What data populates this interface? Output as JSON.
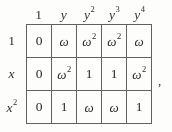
{
  "figure": {
    "kind": "math-table",
    "background_color": "#fdfdfc",
    "rule_color": "#5d5d5d",
    "text_color": "#222222",
    "trailing_punctuation": ","
  },
  "table": {
    "column_headers": [
      {
        "base": "1",
        "sup": "",
        "italic": false
      },
      {
        "base": "y",
        "sup": "",
        "italic": true
      },
      {
        "base": "y",
        "sup": "2",
        "italic": true
      },
      {
        "base": "y",
        "sup": "3",
        "italic": true
      },
      {
        "base": "y",
        "sup": "4",
        "italic": true
      }
    ],
    "row_headers": [
      {
        "base": "1",
        "sup": "",
        "italic": false
      },
      {
        "base": "x",
        "sup": "",
        "italic": true
      },
      {
        "base": "x",
        "sup": "2",
        "italic": true
      }
    ],
    "rows": [
      [
        {
          "base": "0",
          "sup": ""
        },
        {
          "base": "ω",
          "sup": ""
        },
        {
          "base": "ω",
          "sup": "2"
        },
        {
          "base": "ω",
          "sup": "2"
        },
        {
          "base": "ω",
          "sup": ""
        }
      ],
      [
        {
          "base": "0",
          "sup": ""
        },
        {
          "base": "ω",
          "sup": "2"
        },
        {
          "base": "1",
          "sup": ""
        },
        {
          "base": "1",
          "sup": ""
        },
        {
          "base": "ω",
          "sup": "2"
        }
      ],
      [
        {
          "base": "0",
          "sup": ""
        },
        {
          "base": "1",
          "sup": ""
        },
        {
          "base": "ω",
          "sup": ""
        },
        {
          "base": "ω",
          "sup": ""
        },
        {
          "base": "1",
          "sup": ""
        }
      ]
    ]
  }
}
